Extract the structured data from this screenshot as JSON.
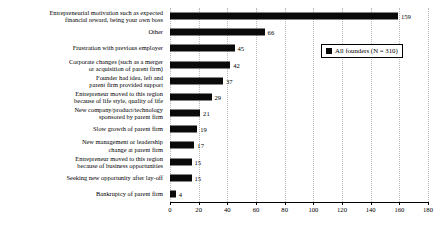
{
  "chart_data": {
    "type": "bar",
    "orientation": "horizontal",
    "title": "",
    "xlabel": "",
    "ylabel": "",
    "xlim": [
      0,
      180
    ],
    "xticks": [
      0,
      20,
      40,
      60,
      80,
      100,
      120,
      140,
      160,
      180
    ],
    "grid": "vertical-dotted",
    "legend_position": "upper-right",
    "series": [
      {
        "name": "All founders (N = 310)",
        "color": "#0a0a0a",
        "values": [
          159,
          66,
          45,
          42,
          37,
          29,
          21,
          19,
          17,
          15,
          15,
          4
        ]
      }
    ],
    "categories": [
      "Entrepreneurial motivation such as expected\nfinancial reward, being your own boss",
      "Other",
      "Frustration with previous employer",
      "Corporate changes (such as a merger\nor acquisition of parent firm)",
      "Founder had idea, left and\nparent firm provided support",
      "Entrepreneur moved to this region\nbecause of life style, quality of life",
      "New company/product/technology\nsponsored by parent firm",
      "Slow growth of parent firm",
      "New management or leadership\nchange at parent firm",
      "Entrepreneur moved to this region\nbecause of business opportunities",
      "Seeking new opportunity after lay-off",
      "Bankruptcy of parent firm"
    ],
    "data_labels": [
      "159",
      "66",
      "45",
      "42",
      "37",
      "29",
      "21",
      "19",
      "17",
      "15",
      "15",
      "4"
    ],
    "xtick_labels": [
      "0",
      "20",
      "40",
      "60",
      "80",
      "100",
      "120",
      "140",
      "160",
      "180"
    ]
  },
  "legend": {
    "entries": [
      {
        "label": "All founders (N = 310)",
        "color": "#0a0a0a",
        "swatch": "square-marker"
      }
    ]
  }
}
